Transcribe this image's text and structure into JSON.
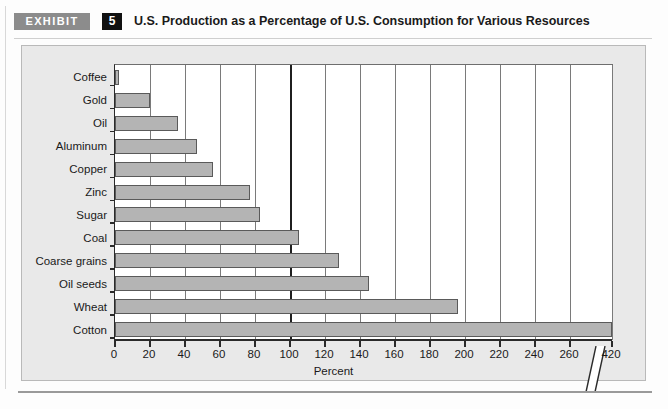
{
  "exhibit": {
    "label": "EXHIBIT",
    "number": "5",
    "title": "U.S. Production as a Percentage of U.S. Consumption for Various Resources"
  },
  "chart_data": {
    "type": "bar",
    "orientation": "horizontal",
    "title": "U.S. Production as a Percentage of U.S. Consumption for Various Resources",
    "xlabel": "Percent",
    "ylabel": "",
    "categories": [
      "Coffee",
      "Gold",
      "Oil",
      "Aluminum",
      "Copper",
      "Zinc",
      "Sugar",
      "Coal",
      "Coarse grains",
      "Oil seeds",
      "Wheat",
      "Cotton"
    ],
    "values": [
      2,
      20,
      36,
      47,
      56,
      77,
      83,
      105,
      128,
      145,
      196,
      420
    ],
    "xticks": [
      0,
      20,
      40,
      60,
      80,
      100,
      120,
      140,
      160,
      180,
      200,
      220,
      240,
      260,
      420
    ],
    "xlim": [
      0,
      420
    ],
    "axis_break": {
      "present": true,
      "between": [
        260,
        420
      ]
    },
    "grid": "vertical",
    "grid_emphasis_at": 100,
    "legend": "none",
    "bar_color": "#b4b4b4",
    "bar_border_color": "#5a5a5a",
    "plot_background": "#ffffff",
    "panel_background": "#e9e9e9"
  },
  "theme": {
    "exhibit_label_bg": "#8c8c8c",
    "exhibit_number_bg": "#111111",
    "axis_color": "#2a2a2a",
    "grid_color": "#7a7a7a"
  }
}
